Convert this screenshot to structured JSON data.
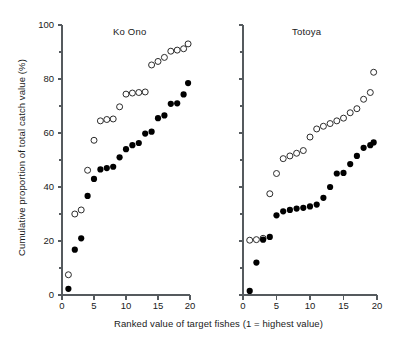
{
  "figure": {
    "xlabel": "Ranked value of target fishes (1 = highest value)",
    "ylabel": "Cumulative proportion of total catch value (%)"
  },
  "panels": [
    {
      "title": "Ko Ono"
    },
    {
      "title": "Totoya"
    }
  ],
  "axes": {
    "y_ticks": [
      "0",
      "20",
      "40",
      "60",
      "80",
      "100"
    ],
    "x_ticks": [
      "0",
      "5",
      "10",
      "15",
      "20"
    ]
  },
  "chart_data": {
    "type": "scatter",
    "title": "",
    "xlabel": "Ranked value of target fishes (1 = highest value)",
    "ylabel": "Cumulative proportion of total catch value (%)",
    "xlim": [
      0,
      20
    ],
    "ylim": [
      0,
      100
    ],
    "x_ticks": [
      0,
      5,
      10,
      15,
      20
    ],
    "y_ticks": [
      0,
      20,
      40,
      60,
      80,
      100
    ],
    "y_minor_ticks": [
      10,
      30,
      50,
      70,
      90
    ],
    "grid": false,
    "legend": null,
    "panels": [
      {
        "name": "Ko Ono",
        "series": [
          {
            "name": "open-circles",
            "marker": "open-circle",
            "color": "#ffffff",
            "edge_color": "#2b2b2b",
            "x": [
              1,
              2,
              3,
              4,
              5,
              6,
              7,
              8,
              9,
              10,
              11,
              12,
              13,
              14,
              15,
              16,
              17,
              18,
              19,
              19.7
            ],
            "y": [
              7.5,
              30.0,
              31.5,
              46.2,
              57.3,
              64.5,
              65.0,
              65.2,
              69.7,
              74.4,
              74.8,
              75.0,
              75.2,
              85.2,
              86.5,
              88.0,
              90.3,
              90.7,
              91.2,
              93.0
            ]
          },
          {
            "name": "filled-circles",
            "marker": "filled-circle",
            "color": "#000000",
            "x": [
              1,
              2,
              3,
              4,
              5,
              6,
              7,
              8,
              9,
              10,
              11,
              12,
              13,
              14,
              15,
              16,
              17,
              18,
              19,
              19.7
            ],
            "y": [
              2.3,
              16.8,
              21.0,
              36.7,
              43.0,
              46.5,
              47.0,
              47.5,
              51.0,
              54.0,
              55.5,
              56.3,
              59.8,
              60.5,
              65.5,
              66.5,
              70.8,
              71.0,
              74.3,
              78.5
            ]
          }
        ]
      },
      {
        "name": "Totoya",
        "series": [
          {
            "name": "open-circles",
            "marker": "open-circle",
            "color": "#ffffff",
            "edge_color": "#2b2b2b",
            "x": [
              1,
              2,
              3,
              4,
              5,
              6,
              7,
              8,
              9,
              10,
              11,
              12,
              13,
              14,
              15,
              16,
              17,
              18,
              19,
              19.5
            ],
            "y": [
              20.3,
              20.5,
              21.0,
              37.5,
              45.0,
              50.5,
              51.5,
              52.5,
              53.5,
              58.5,
              61.5,
              62.5,
              63.5,
              64.5,
              65.5,
              67.5,
              69.0,
              72.5,
              75.0,
              82.5
            ]
          },
          {
            "name": "filled-circles",
            "marker": "filled-circle",
            "color": "#000000",
            "x": [
              1,
              2,
              3,
              4,
              5,
              6,
              7,
              8,
              9,
              10,
              11,
              12,
              13,
              14,
              15,
              16,
              17,
              18,
              19,
              19.5
            ],
            "y": [
              1.5,
              12.0,
              20.5,
              21.5,
              29.5,
              31.0,
              31.5,
              32.0,
              32.3,
              32.8,
              33.5,
              36.0,
              40.0,
              45.0,
              45.2,
              48.5,
              51.5,
              54.5,
              55.5,
              56.5
            ]
          }
        ]
      }
    ]
  }
}
